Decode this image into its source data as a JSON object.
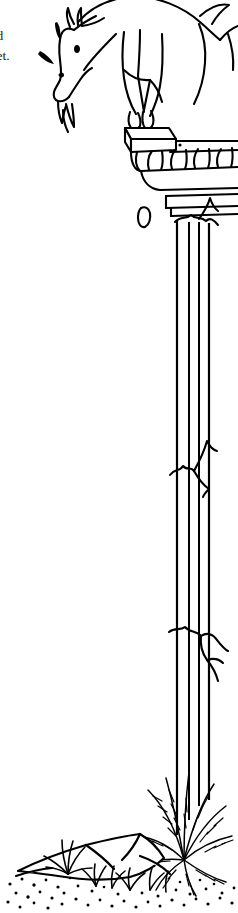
{
  "page": {
    "background_color": "#ffffff",
    "ink_color": "#000000",
    "width": 238,
    "height": 913,
    "kind": "line-art-illustration"
  },
  "caption": {
    "clipped_note": "text is cut off at the left page edge",
    "lines": [
      "uld",
      "reet."
    ],
    "text_color": "#231f20"
  },
  "illustration": {
    "title": "goat standing on a broken classical column",
    "style": "black ink line drawing, no shading fills",
    "stroke_color": "#000000",
    "fill_color": "#ffffff",
    "elements": [
      {
        "name": "goat",
        "label": "Goat",
        "description": "goat leaning down from top-right, head lowered at left, body cropped by the top edge",
        "parts": [
          "head",
          "horns",
          "eye",
          "nostril",
          "beard",
          "neck",
          "body",
          "tail",
          "front-legs",
          "hooves"
        ]
      },
      {
        "name": "surprise-marks",
        "label": "Motion marks",
        "description": "two short tapered strokes near the goat's head indicating alarm"
      },
      {
        "name": "column-capital",
        "label": "Column capital",
        "description": "abacus slab above an egg-and-dart ovolo band of five ovals, with echinus and neck mouldings below",
        "egg_count": 5
      },
      {
        "name": "column-shaft",
        "label": "Fluted column shaft",
        "description": "tall fluted shaft with four vertical flute lines running the height of the image",
        "flute_lines": 4
      },
      {
        "name": "column-cracks",
        "label": "Cracks",
        "description": "jagged crack marks at the top of the shaft, at mid height and lower down",
        "crack_count": 3
      },
      {
        "name": "falling-pebble",
        "label": "Falling stone chip",
        "description": "small broken stone fragment floating in the air to the left of the shaft"
      },
      {
        "name": "ground-rocks",
        "label": "Rocks",
        "description": "angular boulders at the base of the column"
      },
      {
        "name": "grass-tufts",
        "label": "Grass",
        "description": "small spiky grass tufts growing among the rocks"
      },
      {
        "name": "fern-plant",
        "label": "Fern clump",
        "description": "large spray of feathery fronds at the base, right of the rocks"
      },
      {
        "name": "ground-stipple",
        "label": "Stippled ground",
        "description": "scattered dots of gravel along the ground line at the bottom"
      }
    ]
  }
}
